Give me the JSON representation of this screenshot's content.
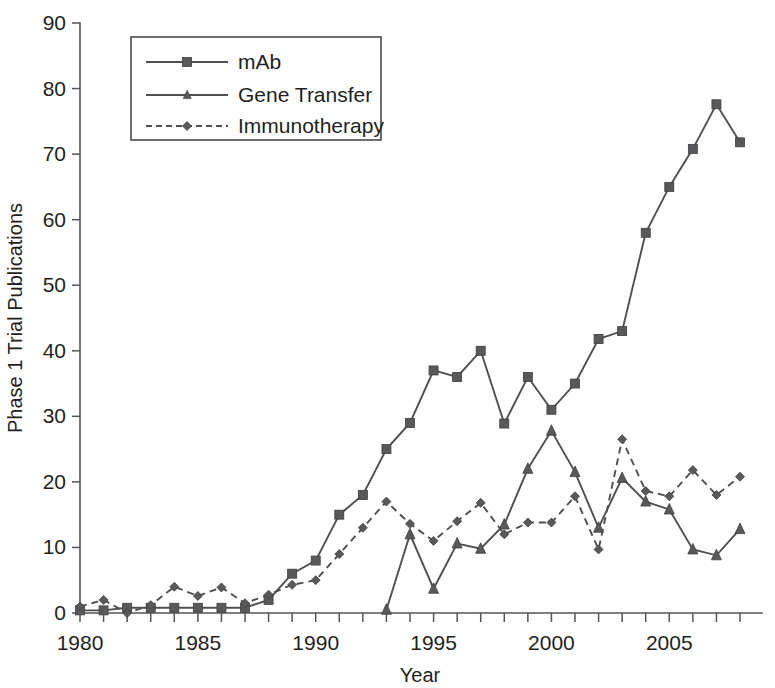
{
  "chart_data": {
    "type": "line",
    "title": "",
    "xlabel": "Year",
    "ylabel": "Phase 1 Trial Publications",
    "xlim": [
      1980,
      2008
    ],
    "ylim": [
      0,
      90
    ],
    "ytick_labels": [
      "0",
      "10",
      "20",
      "30",
      "40",
      "50",
      "60",
      "70",
      "80",
      "90"
    ],
    "yticks": [
      0,
      10,
      20,
      30,
      40,
      50,
      60,
      70,
      80,
      90
    ],
    "xtick_labels": [
      "1980",
      "1985",
      "1990",
      "1995",
      "2000",
      "2005"
    ],
    "xticks_major": [
      1980,
      1985,
      1990,
      1995,
      2000,
      2005
    ],
    "xticks_minor_step": 1,
    "grid": false,
    "legend_position": "top-left-inside",
    "x": [
      1980,
      1981,
      1982,
      1983,
      1984,
      1985,
      1986,
      1987,
      1988,
      1989,
      1990,
      1991,
      1992,
      1993,
      1994,
      1995,
      1996,
      1997,
      1998,
      1999,
      2000,
      2001,
      2002,
      2003,
      2004,
      2005,
      2006,
      2007,
      2008
    ],
    "series": [
      {
        "name": "mAb",
        "marker": "square",
        "linestyle": "solid",
        "color": "#5a585a",
        "x": [
          1980,
          1981,
          1982,
          1983,
          1984,
          1985,
          1986,
          1987,
          1988,
          1989,
          1990,
          1991,
          1992,
          1993,
          1994,
          1995,
          1996,
          1997,
          1998,
          1999,
          2000,
          2001,
          2002,
          2003,
          2004,
          2005,
          2006,
          2007,
          2008
        ],
        "values": [
          0.4,
          0.4,
          0.8,
          0.8,
          0.8,
          0.8,
          0.8,
          0.8,
          2.0,
          6.0,
          8.0,
          15.0,
          18.0,
          25.0,
          29.0,
          37.0,
          36.0,
          40.0,
          28.9,
          36.0,
          31.0,
          35.0,
          41.8,
          43.0,
          58.0,
          65.0,
          70.8,
          77.6,
          71.8
        ]
      },
      {
        "name": "Gene Transfer",
        "marker": "triangle",
        "linestyle": "solid",
        "color": "#5a585a",
        "x": [
          1993,
          1994,
          1995,
          1996,
          1997,
          1998,
          1999,
          2000,
          2001,
          2002,
          2003,
          2004,
          2005,
          2006,
          2007,
          2008
        ],
        "values": [
          0.5,
          12.0,
          3.7,
          10.6,
          9.8,
          13.5,
          22.0,
          27.8,
          21.5,
          13.0,
          20.6,
          17.0,
          15.8,
          9.7,
          8.8,
          12.8
        ]
      },
      {
        "name": "Immunotherapy",
        "marker": "diamond",
        "linestyle": "dashed",
        "color": "#5a585a",
        "x": [
          1980,
          1981,
          1982,
          1983,
          1984,
          1985,
          1986,
          1987,
          1988,
          1989,
          1990,
          1991,
          1992,
          1993,
          1994,
          1995,
          1996,
          1997,
          1998,
          1999,
          2000,
          2001,
          2002,
          2003,
          2004,
          2005,
          2006,
          2007,
          2008
        ],
        "values": [
          1.0,
          2.0,
          0.0,
          1.2,
          4.0,
          2.6,
          3.9,
          1.5,
          2.8,
          4.3,
          5.0,
          9.0,
          13.0,
          17.0,
          13.6,
          11.0,
          14.0,
          16.8,
          12.0,
          13.8,
          13.8,
          17.8,
          9.7,
          26.5,
          18.6,
          17.8,
          21.8,
          18.0,
          20.8
        ]
      }
    ]
  },
  "legend": {
    "items": [
      {
        "label": "mAb"
      },
      {
        "label": "Gene Transfer"
      },
      {
        "label": "Immunotherapy"
      }
    ]
  },
  "axes": {
    "y_title": "Phase 1 Trial Publications",
    "x_title": "Year"
  }
}
